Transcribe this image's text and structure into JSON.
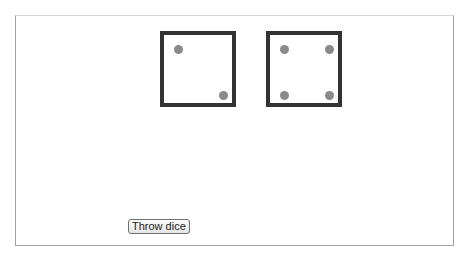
{
  "game": {
    "dice": [
      {
        "value": 2,
        "pips": [
          {
            "x": 15,
            "y": 15
          },
          {
            "x": 60,
            "y": 61
          }
        ]
      },
      {
        "value": 4,
        "pips": [
          {
            "x": 15,
            "y": 15
          },
          {
            "x": 60,
            "y": 15
          },
          {
            "x": 15,
            "y": 61
          },
          {
            "x": 60,
            "y": 61
          }
        ]
      }
    ],
    "colors": {
      "die_border": "#333333",
      "pip": "#8a8a8a"
    }
  },
  "controls": {
    "throw_label": "Throw dice"
  }
}
